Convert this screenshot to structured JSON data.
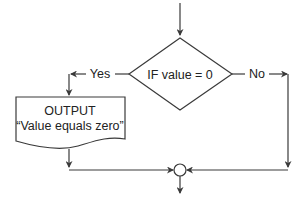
{
  "diagram": {
    "type": "flowchart",
    "decision": {
      "label": "IF value = 0"
    },
    "branches": {
      "yes_label": "Yes",
      "no_label": "No"
    },
    "output_box": {
      "title": "OUTPUT",
      "text": "“Value equals zero”"
    },
    "colors": {
      "stroke": "#3a3a3a",
      "fill": "#ffffff",
      "text": "#222222"
    }
  }
}
